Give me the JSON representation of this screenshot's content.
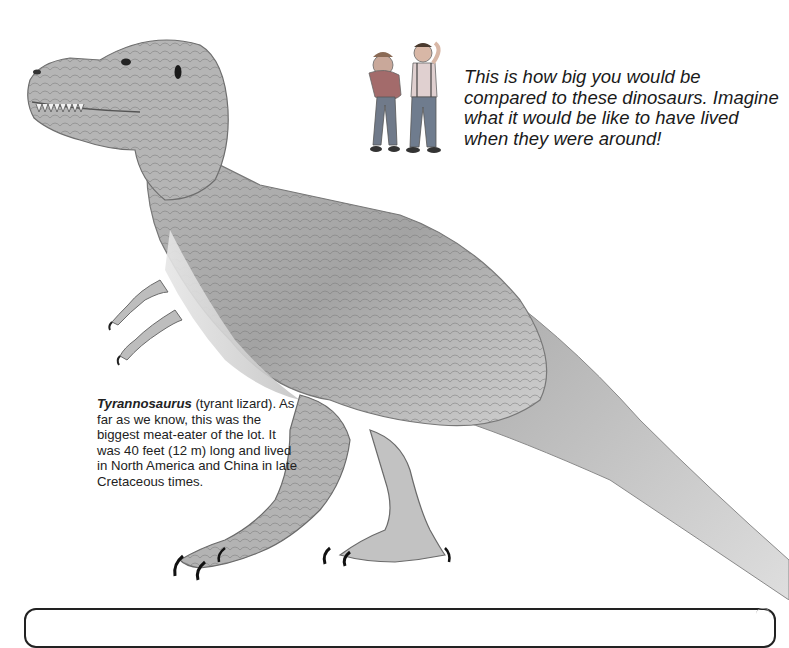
{
  "page": {
    "scale_caption": "This is how big you would be compared to these dinosaurs. Imagine what it would be like to have lived when they were around!",
    "species": {
      "name": "Tyrannosaurus",
      "description": " (tyrant lizard). As far as we know, this was the biggest meat-eater of the lot. It was 40 feet (12 m) long and lived in North America and China in late Cretaceous times."
    }
  },
  "illustrations": {
    "dinosaur": "tyrannosaurus-illustration",
    "children": "two-children-scale-figures"
  },
  "colors": {
    "background": "#ffffff",
    "text": "#1a1a1a",
    "dino_light": "#d9d9d9",
    "dino_mid": "#a6a6a6",
    "dino_dark": "#5e5e5e",
    "box_border": "#222222"
  }
}
